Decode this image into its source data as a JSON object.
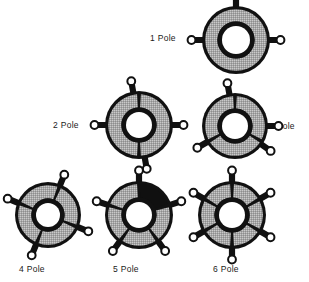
{
  "figure": {
    "background_color": "#ffffff",
    "colors": {
      "outline": "#111111",
      "body_gray": "#a6a6a6",
      "dark_segment": "#101010",
      "hole_white": "#ffffff",
      "text": "#1a1a1a"
    },
    "items": [
      {
        "id": "one-pole",
        "label": "1 Pole",
        "poles": 1,
        "tabs": 3,
        "label_position": "left",
        "center": [
          236,
          40
        ],
        "outer_radius": 34,
        "inner_radius": 14,
        "dark_segment_index": null,
        "spoke_angles": []
      },
      {
        "id": "two-pole",
        "label": "2 Pole",
        "poles": 2,
        "tabs": 3,
        "label_position": "left",
        "center": [
          139,
          125
        ],
        "outer_radius": 34,
        "inner_radius": 13,
        "dark_segment_index": null,
        "spoke_angles": [
          -90,
          90
        ]
      },
      {
        "id": "three-pole",
        "label": "3 Pole",
        "poles": 3,
        "tabs": 3,
        "label_position": "right",
        "center": [
          235,
          126
        ],
        "outer_radius": 33,
        "inner_radius": 13,
        "dark_segment_index": null,
        "spoke_angles": [
          -90,
          30,
          150
        ]
      },
      {
        "id": "four-pole",
        "label": "4 Pole",
        "poles": 4,
        "tabs": 4,
        "label_position": "bottom",
        "center": [
          48,
          215
        ],
        "outer_radius": 33,
        "inner_radius": 12,
        "dark_segment_index": null,
        "spoke_angles": [
          -68,
          22,
          112,
          202
        ]
      },
      {
        "id": "five-pole",
        "label": "5 Pole",
        "poles": 5,
        "tabs": 5,
        "label_position": "bottom",
        "center": [
          139,
          215
        ],
        "outer_radius": 34,
        "inner_radius": 13,
        "dark_segment_index": 0,
        "spoke_angles": [
          -90,
          -18,
          54,
          126,
          198
        ]
      },
      {
        "id": "six-pole",
        "label": "6 Pole",
        "poles": 6,
        "tabs": 6,
        "label_position": "bottom",
        "center": [
          232,
          215
        ],
        "outer_radius": 34,
        "inner_radius": 13,
        "dark_segment_index": null,
        "spoke_angles": [
          -90,
          -30,
          30,
          90,
          150,
          210
        ]
      }
    ],
    "labels": {
      "one_pole": "1 Pole",
      "two_pole": "2 Pole",
      "three_pole": "3 Pole",
      "four_pole": "4 Pole",
      "five_pole": "5 Pole",
      "six_pole": "6 Pole"
    }
  }
}
